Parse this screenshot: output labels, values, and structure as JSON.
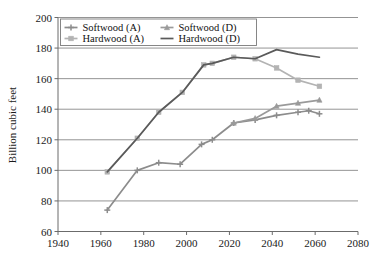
{
  "chart_data": {
    "type": "line",
    "title": "",
    "xlabel": "",
    "ylabel": "Billion cubic feet",
    "xlim": [
      1940,
      2080
    ],
    "ylim": [
      60,
      200
    ],
    "xticks": [
      1940,
      1960,
      1980,
      2000,
      2020,
      2040,
      2060,
      2080
    ],
    "yticks": [
      60,
      80,
      100,
      120,
      140,
      160,
      180,
      200
    ],
    "grid": "horizontal",
    "legend_position": "top-left-inside",
    "series": [
      {
        "name": "Softwood (A)",
        "color": "#8c8c8c",
        "marker": "plus",
        "x": [
          1963,
          1977,
          1987,
          1997,
          2007,
          2012,
          2022,
          2032,
          2042,
          2052,
          2057,
          2062
        ],
        "y": [
          74,
          100,
          105,
          104,
          117,
          120,
          131,
          133,
          136,
          138,
          139,
          137
        ]
      },
      {
        "name": "Softwood (D)",
        "color": "#9a9a9a",
        "marker": "triangle",
        "x": [
          2022,
          2032,
          2042,
          2052,
          2062
        ],
        "y": [
          131,
          134,
          142,
          144,
          146
        ]
      },
      {
        "name": "Hardwood (A)",
        "color": "#b3b3b3",
        "marker": "square",
        "x": [
          1963,
          1977,
          1987,
          1998,
          2008,
          2012,
          2022,
          2032,
          2042,
          2052,
          2062
        ],
        "y": [
          99,
          121,
          138,
          151,
          169,
          170,
          174,
          173,
          167,
          159,
          155
        ]
      },
      {
        "name": "Hardwood (D)",
        "color": "#5a5a5a",
        "marker": "none",
        "x": [
          1963,
          1977,
          1987,
          1998,
          2008,
          2012,
          2022,
          2032,
          2042,
          2052,
          2062
        ],
        "y": [
          99,
          121,
          138,
          151,
          169,
          170,
          174,
          173,
          179,
          176,
          174
        ]
      }
    ],
    "legend_entries": [
      {
        "label": "Softwood (A)",
        "color": "#8c8c8c",
        "marker": "plus"
      },
      {
        "label": "Softwood (D)",
        "color": "#9a9a9a",
        "marker": "triangle"
      },
      {
        "label": "Hardwood (A)",
        "color": "#b3b3b3",
        "marker": "square"
      },
      {
        "label": "Hardwood (D)",
        "color": "#5a5a5a",
        "marker": "none"
      }
    ]
  },
  "axes": {
    "y_title": "Billion cubic feet",
    "y_tick_labels": [
      "200",
      "180",
      "160",
      "140",
      "120",
      "100",
      "80",
      "60"
    ],
    "x_tick_labels": [
      "1940",
      "1960",
      "1980",
      "2000",
      "2020",
      "2040",
      "2060",
      "2080"
    ]
  },
  "colors": {
    "grid": "#888888",
    "axis": "#6b6b6b",
    "text": "#1a1a1a",
    "background": "#ffffff"
  }
}
